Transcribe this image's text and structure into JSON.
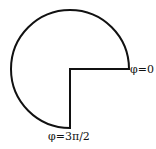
{
  "diagram": {
    "shape": {
      "center": [
        70,
        69
      ],
      "radius": 59,
      "start_angle_label": "φ=0",
      "end_angle_label": "φ=3π/2",
      "stroke_color": "#111111",
      "fill_color": "#ffffff"
    },
    "labels": {
      "phi_zero": "φ=0",
      "phi_three_pi_over_two": "φ=3π/2"
    }
  }
}
